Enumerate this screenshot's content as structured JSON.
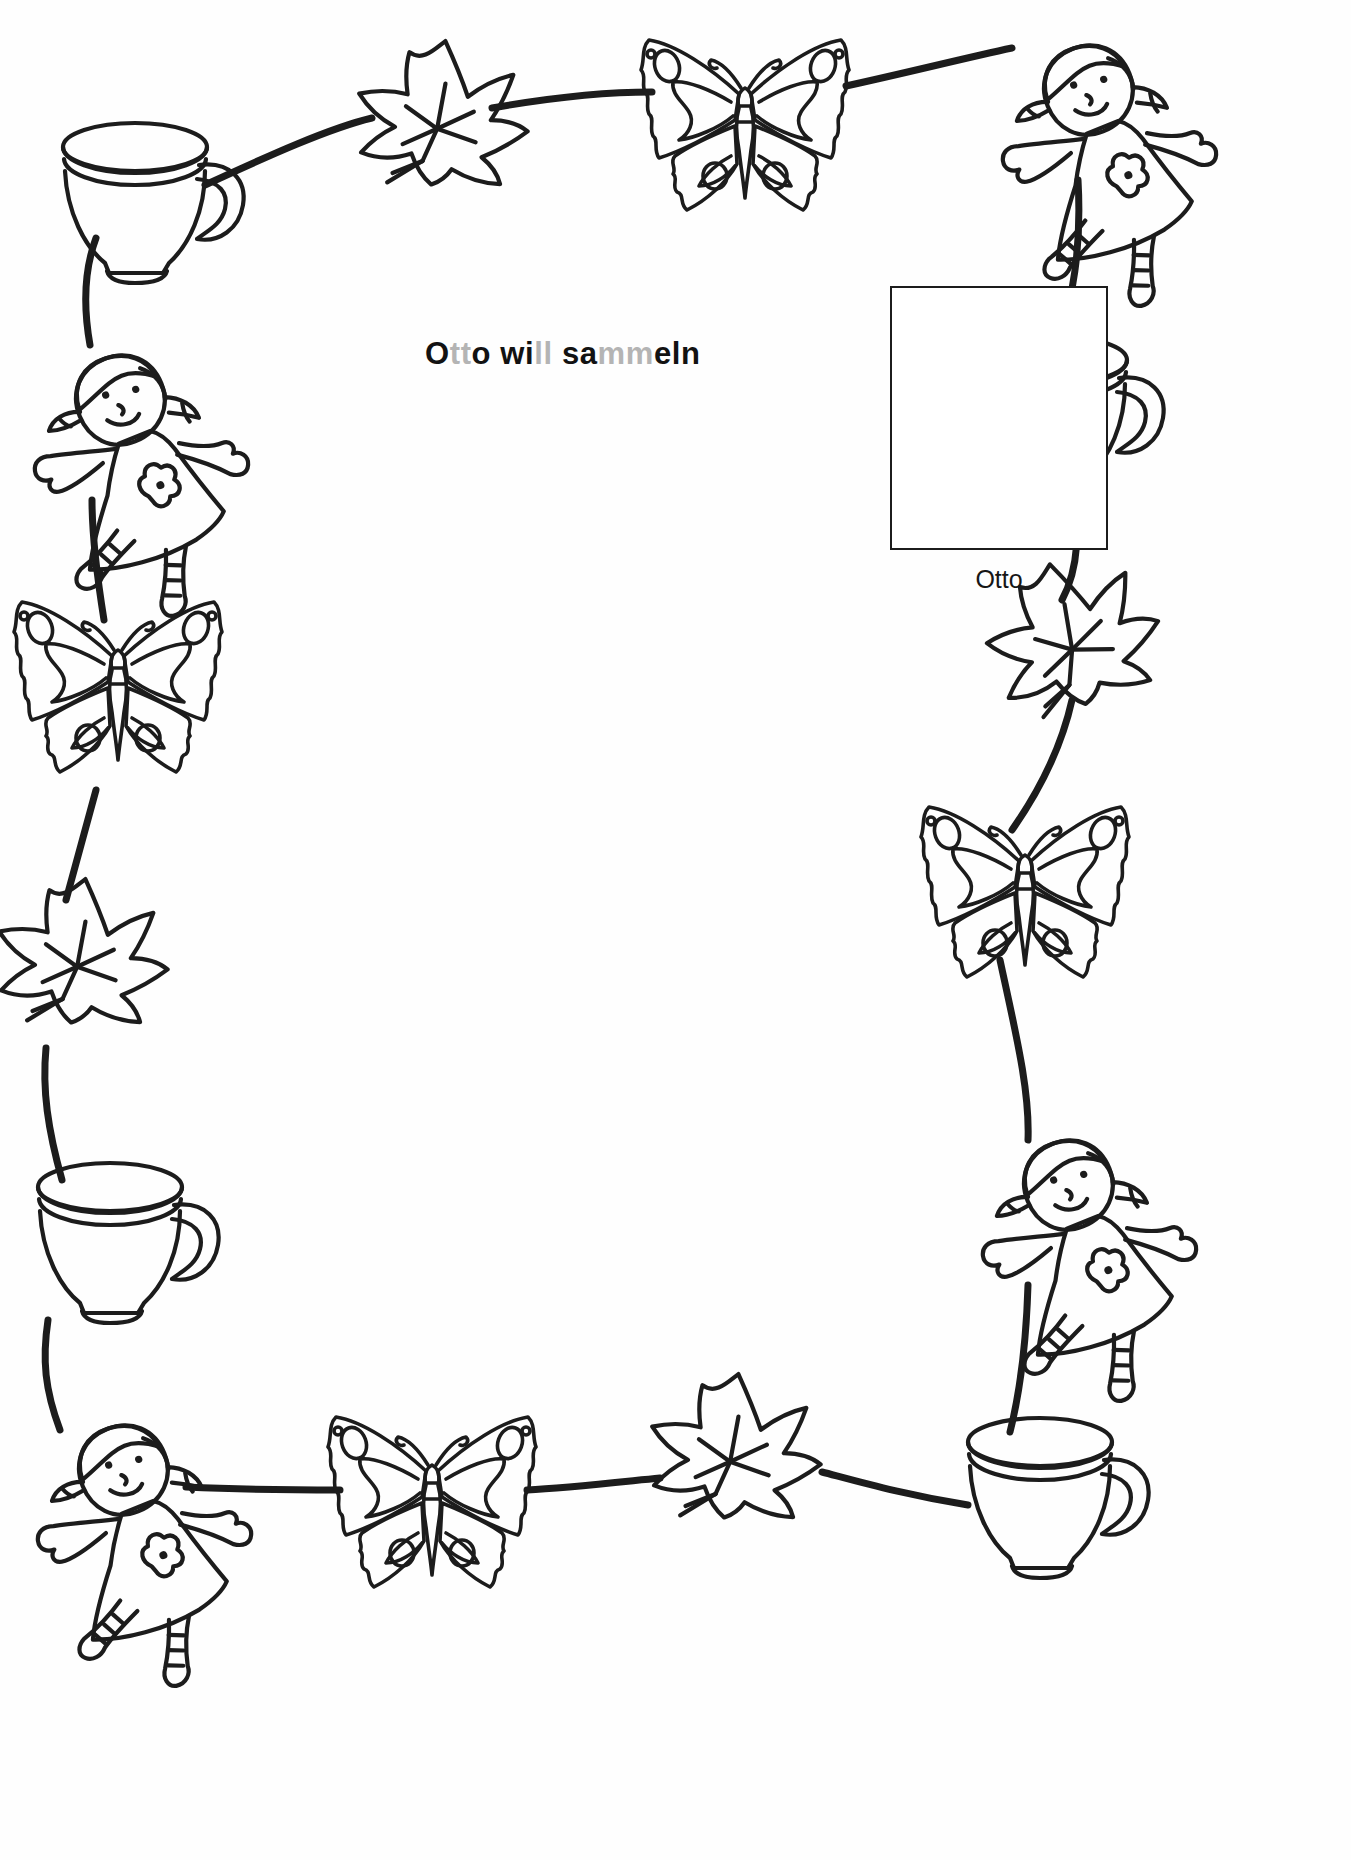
{
  "worksheet": {
    "title_full": "Otto will sammeln",
    "title_segments": [
      {
        "text": "O",
        "shade": "dark"
      },
      {
        "text": "tt",
        "shade": "light"
      },
      {
        "text": "o wi",
        "shade": "dark"
      },
      {
        "text": "ll",
        "shade": "light"
      },
      {
        "text": " sa",
        "shade": "dark"
      },
      {
        "text": "mm",
        "shade": "light"
      },
      {
        "text": "eln",
        "shade": "dark"
      }
    ],
    "answer_box": {
      "value": "",
      "label": "Otto"
    },
    "colors": {
      "ink": "#1c1c1c",
      "title_dark": "#121212",
      "title_light": "#b4b4b4",
      "paper": "#ffffff"
    },
    "border_items": [
      {
        "id": "cup-top-left",
        "icon": "teacup-icon",
        "x": 135,
        "y": 195,
        "scale": 1.0,
        "rotate": 0
      },
      {
        "id": "leaf-top-1",
        "icon": "leaf-icon",
        "x": 432,
        "y": 122,
        "scale": 1.0,
        "rotate": 8
      },
      {
        "id": "butterfly-top-1",
        "icon": "butterfly-icon",
        "x": 745,
        "y": 128,
        "scale": 1.0,
        "rotate": 0
      },
      {
        "id": "doll-top-right",
        "icon": "doll-icon",
        "x": 1060,
        "y": 110,
        "scale": 1.0,
        "rotate": -22
      },
      {
        "id": "cup-right-1",
        "icon": "teacup-icon",
        "x": 1055,
        "y": 408,
        "scale": 1.0,
        "rotate": 0
      },
      {
        "id": "leaf-right-1",
        "icon": "leaf-icon",
        "x": 1065,
        "y": 645,
        "scale": 1.0,
        "rotate": -12
      },
      {
        "id": "butterfly-right-1",
        "icon": "butterfly-icon",
        "x": 1025,
        "y": 895,
        "scale": 1.0,
        "rotate": 0
      },
      {
        "id": "doll-right-1",
        "icon": "doll-icon",
        "x": 1040,
        "y": 1205,
        "scale": 1.0,
        "rotate": -22
      },
      {
        "id": "cup-bottom-right",
        "icon": "teacup-icon",
        "x": 1040,
        "y": 1490,
        "scale": 1.0,
        "rotate": 0
      },
      {
        "id": "leaf-bottom-1",
        "icon": "leaf-icon",
        "x": 725,
        "y": 1455,
        "scale": 1.0,
        "rotate": 8
      },
      {
        "id": "butterfly-bottom-1",
        "icon": "butterfly-icon",
        "x": 432,
        "y": 1505,
        "scale": 1.0,
        "rotate": 0
      },
      {
        "id": "doll-bottom-left",
        "icon": "doll-icon",
        "x": 95,
        "y": 1490,
        "scale": 1.0,
        "rotate": -22
      },
      {
        "id": "cup-left-1",
        "icon": "teacup-icon",
        "x": 110,
        "y": 1235,
        "scale": 1.0,
        "rotate": 0
      },
      {
        "id": "leaf-left-1",
        "icon": "leaf-icon",
        "x": 72,
        "y": 960,
        "scale": 1.0,
        "rotate": 8
      },
      {
        "id": "butterfly-left-1",
        "icon": "butterfly-icon",
        "x": 118,
        "y": 690,
        "scale": 1.0,
        "rotate": 0
      },
      {
        "id": "doll-left-1",
        "icon": "doll-icon",
        "x": 92,
        "y": 420,
        "scale": 1.0,
        "rotate": -22
      }
    ],
    "pattern_sequence": [
      "teacup",
      "leaf",
      "butterfly",
      "doll"
    ],
    "connector_count": 16
  }
}
